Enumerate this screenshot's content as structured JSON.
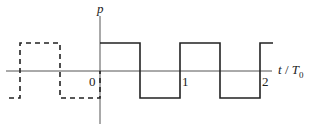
{
  "diagram": {
    "y_axis_label": "p",
    "x_axis_label_t": "t",
    "x_axis_label_sep": "/",
    "x_axis_label_T": "T",
    "x_axis_label_sub": "0",
    "tick_labels": [
      "0",
      "1",
      "2"
    ],
    "waveform": "square wave, solid for t>=0, dashed (periodic extension) for t<0",
    "colors": {
      "line": "#222222",
      "axis": "#555555"
    }
  }
}
